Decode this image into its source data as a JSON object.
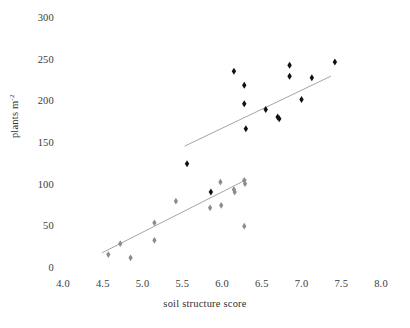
{
  "chart_data": {
    "type": "scatter",
    "title": "",
    "xlabel": "soil structure score",
    "ylabel": "plants m-2",
    "ylabel_base": "plants m",
    "ylabel_exponent": "-2",
    "xlim": [
      4.0,
      8.0
    ],
    "ylim": [
      0,
      300
    ],
    "xticks": [
      4.0,
      4.5,
      5.0,
      5.5,
      6.0,
      6.5,
      7.0,
      7.5,
      8.0
    ],
    "xtick_labels": [
      "4.0",
      "4.5",
      "5.0",
      "5.5",
      "6.0",
      "6.5",
      "7.0",
      "7.5",
      "8.0"
    ],
    "yticks": [
      0,
      50,
      100,
      150,
      200,
      250,
      300
    ],
    "ytick_labels": [
      "0",
      "50",
      "100",
      "150",
      "200",
      "250",
      "300"
    ],
    "grid": false,
    "legend": "none",
    "axes_visible": false,
    "series": [
      {
        "name": "black-diamonds",
        "marker": "diamond",
        "color": "#111111",
        "size": 5.2,
        "points": [
          {
            "x": 5.56,
            "y": 124
          },
          {
            "x": 5.86,
            "y": 90
          },
          {
            "x": 6.15,
            "y": 235
          },
          {
            "x": 6.28,
            "y": 218
          },
          {
            "x": 6.28,
            "y": 196
          },
          {
            "x": 6.3,
            "y": 166
          },
          {
            "x": 6.55,
            "y": 189
          },
          {
            "x": 6.7,
            "y": 180
          },
          {
            "x": 6.72,
            "y": 178
          },
          {
            "x": 6.85,
            "y": 242
          },
          {
            "x": 6.85,
            "y": 229
          },
          {
            "x": 7.0,
            "y": 201
          },
          {
            "x": 7.13,
            "y": 227
          },
          {
            "x": 7.42,
            "y": 246
          }
        ]
      },
      {
        "name": "grey-diamonds",
        "marker": "diamond",
        "color": "#8c8c8c",
        "size": 5.0,
        "points": [
          {
            "x": 4.57,
            "y": 15
          },
          {
            "x": 4.72,
            "y": 28
          },
          {
            "x": 4.85,
            "y": 11
          },
          {
            "x": 5.15,
            "y": 53
          },
          {
            "x": 5.15,
            "y": 32
          },
          {
            "x": 5.42,
            "y": 79
          },
          {
            "x": 5.85,
            "y": 71
          },
          {
            "x": 5.98,
            "y": 102
          },
          {
            "x": 5.99,
            "y": 74
          },
          {
            "x": 6.15,
            "y": 93
          },
          {
            "x": 6.16,
            "y": 90
          },
          {
            "x": 6.28,
            "y": 104
          },
          {
            "x": 6.29,
            "y": 100
          },
          {
            "x": 6.28,
            "y": 49
          }
        ]
      }
    ],
    "trendlines": [
      {
        "name": "black-trendline",
        "color": "#9a9a9a",
        "x_start": 5.53,
        "y_start": 145,
        "x_end": 7.37,
        "y_end": 229
      },
      {
        "name": "grey-trendline",
        "color": "#9a9a9a",
        "x_start": 4.49,
        "y_start": 17,
        "x_end": 6.31,
        "y_end": 105
      }
    ]
  }
}
